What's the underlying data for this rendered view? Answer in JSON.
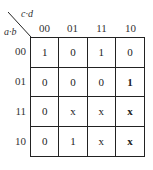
{
  "kmap": {
    "col_var_label": "c·d",
    "row_var_label": "a·b",
    "col_headers": [
      "00",
      "01",
      "11",
      "10"
    ],
    "row_headers": [
      "00",
      "01",
      "11",
      "10"
    ],
    "cells": [
      [
        "1",
        "0",
        "1",
        "0"
      ],
      [
        "0",
        "0",
        "0",
        "1"
      ],
      [
        "0",
        "x",
        "x",
        "x"
      ],
      [
        "0",
        "1",
        "x",
        "x"
      ]
    ],
    "bold_cells": [
      [
        1,
        3
      ],
      [
        2,
        3
      ],
      [
        3,
        3
      ]
    ]
  }
}
